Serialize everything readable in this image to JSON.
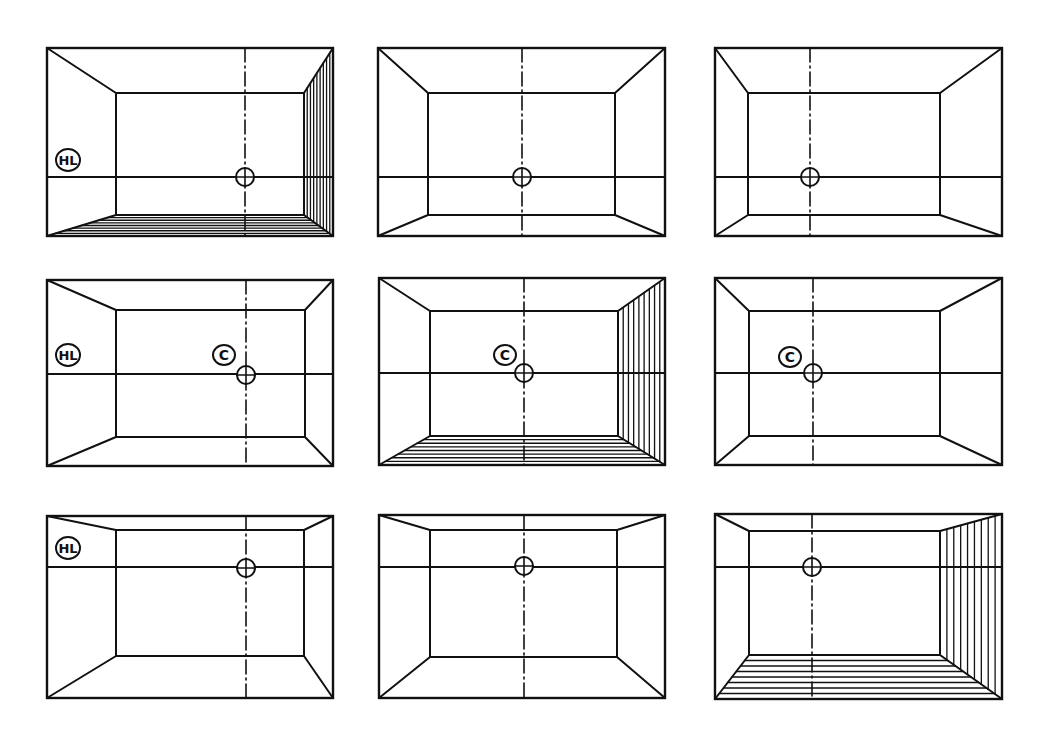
{
  "labels": {
    "horizon": "HL",
    "center": "C"
  },
  "colors": {
    "ink": "#111111",
    "paper": "#ffffff"
  },
  "panels": [
    {
      "id": "p1",
      "outer": [
        47,
        48,
        333,
        236
      ],
      "inner": [
        116,
        93,
        304,
        215
      ],
      "hl": 177,
      "vp": [
        245,
        177
      ],
      "hatch": true,
      "hl_label": [
        68,
        160
      ],
      "c_label": null
    },
    {
      "id": "p2",
      "outer": [
        378,
        48,
        665,
        236
      ],
      "inner": [
        428,
        93,
        615,
        215
      ],
      "hl": 177,
      "vp": [
        522,
        177
      ],
      "hatch": false,
      "hl_label": null,
      "c_label": null
    },
    {
      "id": "p3",
      "outer": [
        715,
        48,
        1002,
        236
      ],
      "inner": [
        748,
        93,
        940,
        215
      ],
      "hl": 177,
      "vp": [
        810,
        177
      ],
      "hatch": false,
      "hl_label": null,
      "c_label": null
    },
    {
      "id": "p4",
      "outer": [
        47,
        280,
        333,
        466
      ],
      "inner": [
        116,
        310,
        305,
        437
      ],
      "hl": 374,
      "vp": [
        246,
        375
      ],
      "hatch": false,
      "hl_label": [
        68,
        355
      ],
      "c_label": [
        224,
        355
      ]
    },
    {
      "id": "p5",
      "outer": [
        379,
        278,
        665,
        465
      ],
      "inner": [
        430,
        311,
        618,
        436
      ],
      "hl": 373,
      "vp": [
        524,
        373
      ],
      "hatch": true,
      "hl_label": null,
      "c_label": [
        505,
        355
      ]
    },
    {
      "id": "p6",
      "outer": [
        715,
        278,
        1002,
        465
      ],
      "inner": [
        749,
        311,
        940,
        436
      ],
      "hl": 373,
      "vp": [
        813,
        373
      ],
      "hatch": false,
      "hl_label": null,
      "c_label": [
        790,
        357
      ]
    },
    {
      "id": "p7",
      "outer": [
        47,
        516,
        333,
        698
      ],
      "inner": [
        116,
        530,
        304,
        656
      ],
      "hl": 567,
      "vp": [
        246,
        568
      ],
      "hatch": false,
      "hl_label": [
        68,
        548
      ],
      "c_label": null
    },
    {
      "id": "p8",
      "outer": [
        379,
        515,
        665,
        698
      ],
      "inner": [
        430,
        530,
        617,
        657
      ],
      "hl": 567,
      "vp": [
        524,
        566
      ],
      "hatch": false,
      "hl_label": null,
      "c_label": null
    },
    {
      "id": "p9",
      "outer": [
        715,
        514,
        1002,
        699
      ],
      "inner": [
        749,
        531,
        940,
        655
      ],
      "hl": 567,
      "vp": [
        812,
        567
      ],
      "hatch": true,
      "hl_label": null,
      "c_label": null
    }
  ]
}
